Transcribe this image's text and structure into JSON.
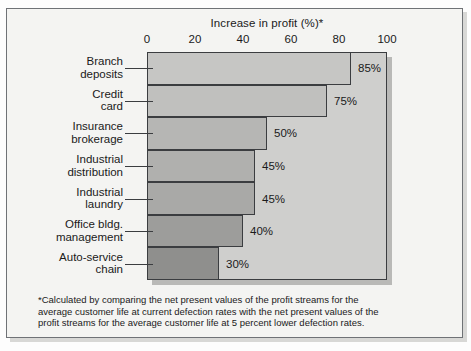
{
  "chart_data": {
    "type": "bar",
    "orientation": "horizontal",
    "title": "Increase in profit (%)*",
    "xlabel": "",
    "ylabel": "",
    "xlim": [
      0,
      100
    ],
    "xticks": [
      0,
      20,
      40,
      60,
      80,
      100
    ],
    "xtick_labels": [
      "0",
      "20",
      "40",
      "60",
      "80",
      "100"
    ],
    "grid": false,
    "legend": "none",
    "axis_position": "top",
    "categories": [
      "Branch deposits",
      "Credit card",
      "Insurance brokerage",
      "Industrial distribution",
      "Industrial laundry",
      "Office bldg. management",
      "Auto-service chain"
    ],
    "category_lines": [
      [
        "Branch",
        "deposits"
      ],
      [
        "Credit",
        "card"
      ],
      [
        "Insurance",
        "brokerage"
      ],
      [
        "Industrial",
        "distribution"
      ],
      [
        "Industrial",
        "laundry"
      ],
      [
        "Office bldg.",
        "management"
      ],
      [
        "Auto-service",
        "chain"
      ]
    ],
    "values": [
      85,
      75,
      50,
      45,
      45,
      40,
      30
    ],
    "value_labels": [
      "85%",
      "75%",
      "50%",
      "45%",
      "45%",
      "40%",
      "30%"
    ],
    "bar_colors": [
      "#c6c6c4",
      "#c0c0be",
      "#b6b6b4",
      "#b0b0ae",
      "#a9a9a7",
      "#9d9d9b",
      "#8f8f8d"
    ],
    "plot_background": "#cfcfcd",
    "axis_color": "#3b3d40",
    "text_color": "#1a1a1a"
  },
  "footnote": {
    "lines": [
      "*Calculated by comparing the net present values of the profit streams for the",
      "average customer life at current defection rates with the net present values of the",
      "profit streams for the average  customer life at 5 percent lower defection rates."
    ]
  }
}
